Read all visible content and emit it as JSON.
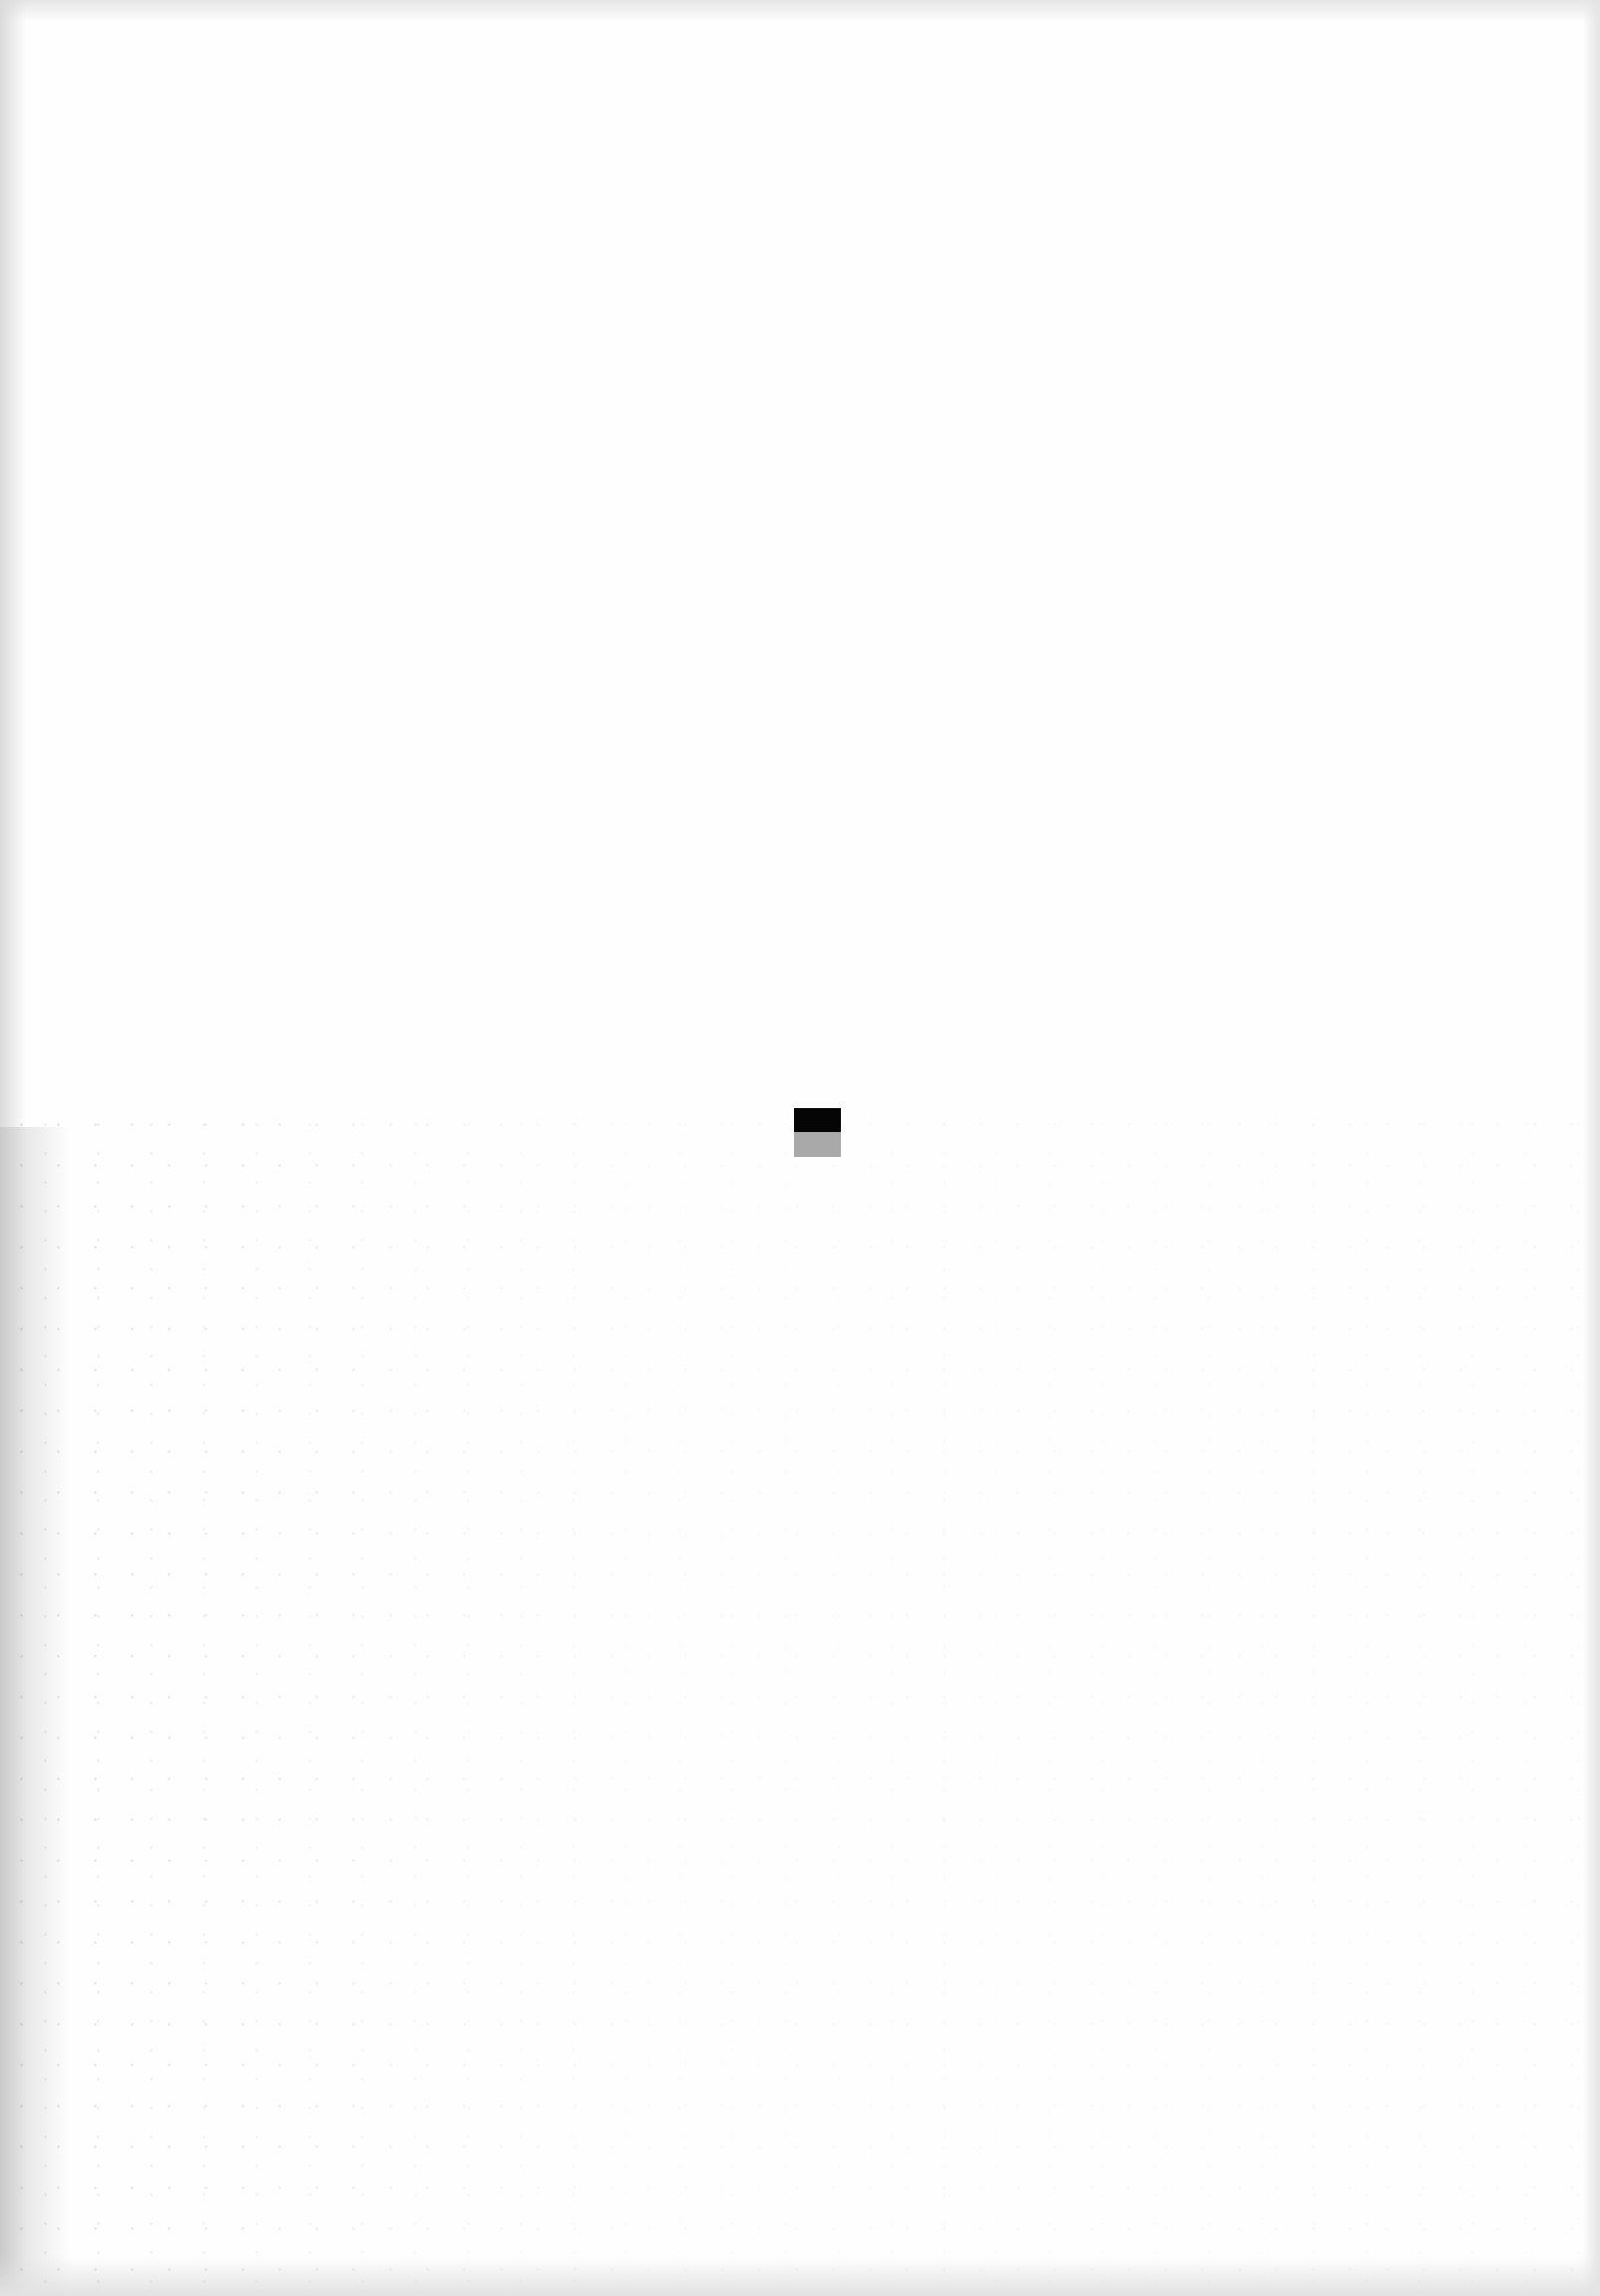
{
  "page": {
    "type": "blank-scanned-page",
    "background_color": "#fefefe",
    "text": ""
  },
  "center_mark": {
    "top_color": "#050505",
    "bottom_color": "#a9a9a9"
  }
}
